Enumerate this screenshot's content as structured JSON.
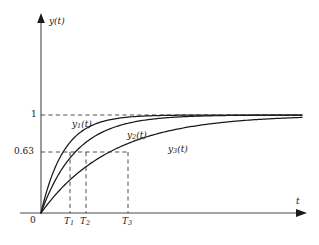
{
  "chart_data": {
    "type": "line",
    "title": "",
    "subtitle": "",
    "xlabel": "t",
    "ylabel": "y(t)",
    "xlim": [
      0,
      11.5
    ],
    "ylim": [
      0,
      1.22
    ],
    "grid": false,
    "legend_position": "inline-annotations",
    "x_tick_labels": [
      "0",
      "T₁",
      "T₂",
      "T₃"
    ],
    "x_tick_values": [
      0,
      1,
      1.55,
      3.1
    ],
    "y_tick_labels": [
      "0.63",
      "1"
    ],
    "y_tick_values": [
      0.63,
      1.0
    ],
    "reference_lines": [
      {
        "name": "y-equals-one",
        "axis": "y",
        "value": 1.0,
        "style": "dashed",
        "label": "1"
      },
      {
        "name": "y-equals-063",
        "axis": "y",
        "value": 0.63,
        "style": "dashed",
        "label": "0.63"
      },
      {
        "name": "t-equals-T1",
        "axis": "x",
        "value": 1.0,
        "style": "dashed",
        "label": "T₁"
      },
      {
        "name": "t-equals-T2",
        "axis": "x",
        "value": 1.55,
        "style": "dashed",
        "label": "T₂"
      },
      {
        "name": "t-equals-T3",
        "axis": "x",
        "value": 3.1,
        "style": "dashed",
        "label": "T₃"
      }
    ],
    "series": [
      {
        "name": "y1",
        "label": "y₁(t)",
        "label_base": "y",
        "label_sub": "1",
        "label_tail": "(t)",
        "time_constant": 1.0,
        "formula": "1 - exp(-t/T1)",
        "color": "#1a1a1a",
        "x": [
          0,
          0.25,
          0.5,
          0.75,
          1.0,
          1.5,
          2.0,
          2.5,
          3.0,
          4.0,
          5.0,
          6.0,
          7.0,
          8.0,
          9.0,
          10.0,
          11.0
        ],
        "y": [
          0,
          0.221,
          0.393,
          0.528,
          0.632,
          0.777,
          0.865,
          0.918,
          0.95,
          0.982,
          0.993,
          0.998,
          0.999,
          1.0,
          1.0,
          1.0,
          1.0
        ]
      },
      {
        "name": "y2",
        "label": "y₂(t)",
        "label_base": "y",
        "label_sub": "2",
        "label_tail": "(t)",
        "time_constant": 1.55,
        "formula": "1 - exp(-t/T2)",
        "color": "#1a1a1a",
        "x": [
          0,
          0.25,
          0.5,
          0.75,
          1.0,
          1.55,
          2.0,
          2.5,
          3.0,
          4.0,
          5.0,
          6.0,
          7.0,
          8.0,
          9.0,
          10.0,
          11.0
        ],
        "y": [
          0,
          0.149,
          0.276,
          0.383,
          0.475,
          0.632,
          0.724,
          0.8,
          0.854,
          0.924,
          0.96,
          0.979,
          0.989,
          0.994,
          0.997,
          0.998,
          0.999
        ]
      },
      {
        "name": "y3",
        "label": "y₃(t)",
        "label_base": "y",
        "label_sub": "3",
        "label_tail": "(t)",
        "time_constant": 3.1,
        "formula": "1 - exp(-t/T3)",
        "color": "#1a1a1a",
        "x": [
          0,
          0.25,
          0.5,
          1.0,
          1.55,
          2.0,
          3.1,
          4.0,
          5.0,
          6.0,
          7.0,
          8.0,
          9.0,
          10.0,
          11.0
        ],
        "y": [
          0,
          0.077,
          0.149,
          0.276,
          0.394,
          0.475,
          0.632,
          0.724,
          0.8,
          0.854,
          0.895,
          0.924,
          0.945,
          0.96,
          0.971
        ]
      }
    ],
    "annotations": [
      {
        "name": "curve-label-y1",
        "text": "y₁(t)",
        "x": 1.0,
        "y": 0.86
      },
      {
        "name": "curve-label-y2",
        "text": "y₂(t)",
        "x": 3.4,
        "y": 0.73
      },
      {
        "name": "curve-label-y3",
        "text": "y₃(t)",
        "x": 6.2,
        "y": 0.65
      }
    ]
  },
  "axes": {
    "y_axis_label": "y(t)",
    "y_axis_label_base": "y",
    "y_axis_label_tail": "(t)",
    "x_axis_label": "t",
    "origin_label": "0"
  },
  "ticks": {
    "y": [
      {
        "name": "y-tick-1",
        "label": "1"
      },
      {
        "name": "y-tick-063",
        "label": "0.63"
      }
    ],
    "x": [
      {
        "name": "x-tick-T1",
        "base": "T",
        "sub": "1"
      },
      {
        "name": "x-tick-T2",
        "base": "T",
        "sub": "2"
      },
      {
        "name": "x-tick-T3",
        "base": "T",
        "sub": "3"
      }
    ]
  },
  "colors": {
    "curve": "#1a1a1a",
    "axis": "#4a4a4a",
    "dashed": "#3a3a3a",
    "background": "#ffffff"
  }
}
